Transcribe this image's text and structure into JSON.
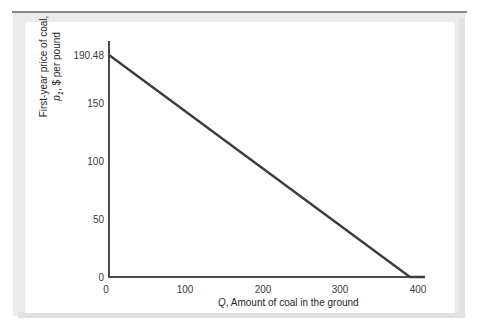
{
  "chart_data": {
    "type": "line",
    "title": "",
    "xlabel": "Q, Amount of coal in the ground",
    "ylabel": "First-year price of coal, p1, $ per pound",
    "ylabel_line1": "First-year price of coal,",
    "ylabel_line2_prefix": "p",
    "ylabel_line2_sub": "1",
    "ylabel_line2_suffix": ", $ per pound",
    "xlabel_symbol": "Q",
    "xlabel_rest": ", Amount of coal in the ground",
    "xlim": [
      0,
      420
    ],
    "ylim": [
      0,
      200
    ],
    "grid": false,
    "legend": null,
    "x_ticks": [
      0,
      100,
      200,
      300,
      400
    ],
    "x_tick_labels": [
      "0",
      "100",
      "200",
      "300",
      "400"
    ],
    "y_ticks": [
      0,
      50,
      100,
      150,
      190.48
    ],
    "y_tick_labels": [
      "0",
      "50",
      "100",
      "150",
      "190.48"
    ],
    "series": [
      {
        "name": "Demand for coal",
        "color": "#3d3d3d",
        "linewidth": 2.4,
        "x": [
          0,
          400,
          420
        ],
        "values": [
          190.48,
          0,
          0
        ],
        "points": [
          {
            "x": 0,
            "y": 190.48
          },
          {
            "x": 100,
            "y": 142.86
          },
          {
            "x": 200,
            "y": 95.24
          },
          {
            "x": 300,
            "y": 47.62
          },
          {
            "x": 400,
            "y": 0
          },
          {
            "x": 420,
            "y": 0
          }
        ]
      }
    ],
    "annotations": [],
    "intercept_y": 190.48,
    "intercept_x": 400
  },
  "figure": {
    "axis_color": "#4a4a4a",
    "line_color": "#3d3d3d",
    "panel_background": "#ffffff",
    "mat_background": "#ebebeb",
    "rule_color": "#8a8a8a"
  }
}
